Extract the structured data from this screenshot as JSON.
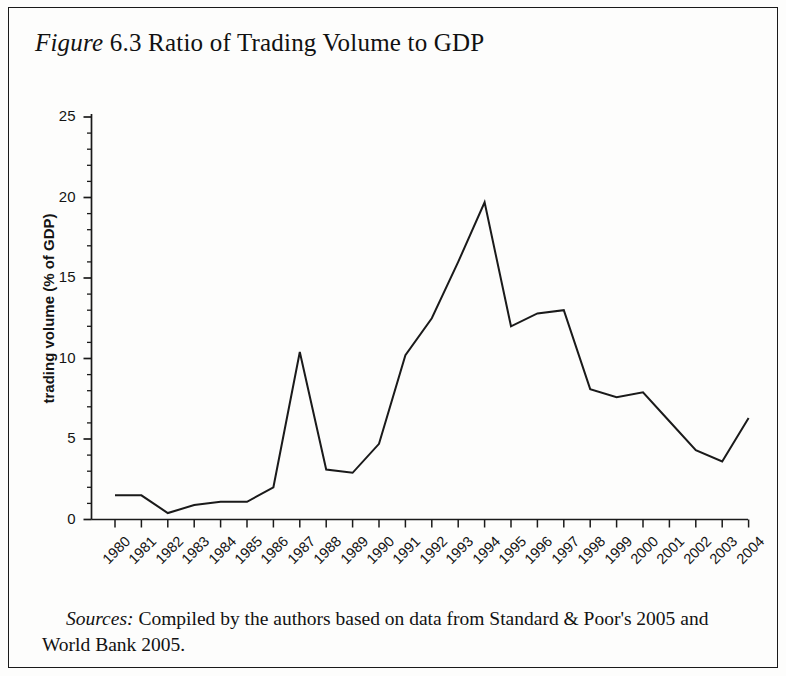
{
  "figure": {
    "title_lead": "Figure",
    "title_rest": " 6.3 Ratio of Trading Volume to GDP",
    "source_lead": "Sources:",
    "source_rest": " Compiled by the authors based on data from Standard & Poor's 2005 and World Bank 2005."
  },
  "chart_data": {
    "type": "line",
    "title": "Figure 6.3 Ratio of Trading Volume to GDP",
    "xlabel": "",
    "ylabel": "trading volume (% of GDP)",
    "xlim": [
      1980,
      2004
    ],
    "ylim": [
      0,
      25
    ],
    "grid": false,
    "legend": "none",
    "line_color": "#1a1a1a",
    "y_ticks": [
      0,
      5,
      10,
      15,
      20,
      25
    ],
    "y_tick_labels": [
      "0",
      "5",
      "10",
      "15",
      "20",
      "25"
    ],
    "y_minor_step": 1,
    "categories": [
      "1980",
      "1981",
      "1982",
      "1983",
      "1984",
      "1985",
      "1986",
      "1987",
      "1988",
      "1989",
      "1990",
      "1991",
      "1992",
      "1993",
      "1994",
      "1995",
      "1996",
      "1997",
      "1998",
      "1999",
      "2000",
      "2001",
      "2002",
      "2003",
      "2004"
    ],
    "x": [
      1980,
      1981,
      1982,
      1983,
      1984,
      1985,
      1986,
      1987,
      1988,
      1989,
      1990,
      1991,
      1992,
      1993,
      1994,
      1995,
      1996,
      1997,
      1998,
      1999,
      2000,
      2001,
      2002,
      2003,
      2004
    ],
    "values": [
      1.5,
      1.5,
      0.4,
      0.9,
      1.1,
      1.1,
      2.0,
      10.4,
      3.1,
      2.9,
      4.7,
      10.2,
      12.5,
      16.0,
      19.7,
      12.0,
      12.8,
      13.0,
      8.1,
      7.6,
      7.9,
      6.1,
      4.3,
      3.6,
      6.3
    ],
    "series": [
      {
        "name": "trading volume (% of GDP)",
        "values": [
          1.5,
          1.5,
          0.4,
          0.9,
          1.1,
          1.1,
          2.0,
          10.4,
          3.1,
          2.9,
          4.7,
          10.2,
          12.5,
          16.0,
          19.7,
          12.0,
          12.8,
          13.0,
          8.1,
          7.6,
          7.9,
          6.1,
          4.3,
          3.6,
          6.3
        ]
      }
    ]
  }
}
